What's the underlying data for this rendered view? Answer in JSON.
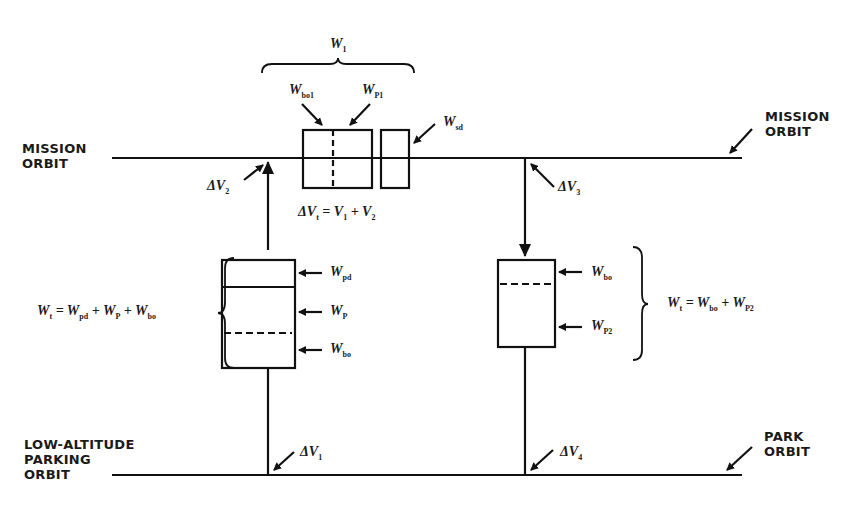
{
  "orbits": {
    "mission": {
      "label_left": [
        "MISSION",
        "ORBIT"
      ],
      "label_right": [
        "MISSION",
        "ORBIT"
      ]
    },
    "parking": {
      "label_left": [
        "LOW-ALTITUDE",
        "PARKING",
        "ORBIT"
      ]
    },
    "park": {
      "label_right": [
        "PARK",
        "ORBIT"
      ]
    }
  },
  "top_stage": {
    "group_label": "W_1",
    "group_sym": "W",
    "group_sub": "1",
    "labels": [
      {
        "sym": "W",
        "sub": "bo1",
        "text": "W_bo1"
      },
      {
        "sym": "W",
        "sub": "P1",
        "text": "W_P1"
      },
      {
        "sym": "W",
        "sub": "sd",
        "text": "W_sd"
      }
    ],
    "equation": "ΔV_t = V_1 + V_2"
  },
  "left_stage": {
    "labels": [
      {
        "sym": "W",
        "sub": "pd",
        "text": "W_pd"
      },
      {
        "sym": "W",
        "sub": "P",
        "text": "W_P"
      },
      {
        "sym": "W",
        "sub": "bo",
        "text": "W_bo"
      }
    ],
    "equation": "W_t = W_pd + W_P + W_bo"
  },
  "right_stage": {
    "labels": [
      {
        "sym": "W",
        "sub": "bo",
        "text": "W_bo"
      },
      {
        "sym": "W",
        "sub": "P2",
        "text": "W_P2"
      }
    ],
    "equation": "W_t = W_bo + W_P2"
  },
  "delta_v": [
    {
      "id": "dv1",
      "text": "ΔV_1",
      "sym": "ΔV",
      "sub": "1"
    },
    {
      "id": "dv2",
      "text": "ΔV_2",
      "sym": "ΔV",
      "sub": "2"
    },
    {
      "id": "dv3",
      "text": "ΔV_3",
      "sym": "ΔV",
      "sub": "3"
    },
    {
      "id": "dv4",
      "text": "ΔV_4",
      "sym": "ΔV",
      "sub": "4"
    }
  ],
  "colors": {
    "ink": "#111111",
    "background": "#ffffff"
  }
}
